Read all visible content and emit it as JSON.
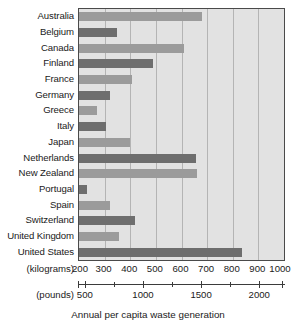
{
  "chart_data": {
    "type": "bar",
    "orientation": "horizontal",
    "title": "",
    "xlabel": "Annual per capita waste generation",
    "ylabel": "",
    "categories": [
      "Australia",
      "Belgium",
      "Canada",
      "Finland",
      "France",
      "Germany",
      "Greece",
      "Italy",
      "Japan",
      "Netherlands",
      "New Zealand",
      "Portugal",
      "Spain",
      "Switzerland",
      "United Kingdom",
      "United States"
    ],
    "values": [
      680,
      350,
      610,
      490,
      405,
      320,
      270,
      305,
      400,
      655,
      660,
      230,
      320,
      420,
      355,
      835
    ],
    "value_unit": "kilograms",
    "xlim": [
      200,
      1000
    ],
    "xticks": [
      200,
      300,
      400,
      500,
      600,
      700,
      800,
      900,
      1000
    ],
    "xtick_labels": [
      "200",
      "300",
      "400",
      "500",
      "600",
      "700",
      "800",
      "900",
      "1000"
    ],
    "secondary_axis": {
      "unit": "pounds",
      "lim": [
        441,
        2205
      ],
      "ticks": [
        500,
        1000,
        1500,
        2000
      ],
      "tick_labels": [
        "500",
        "1000",
        "1500",
        "2000"
      ],
      "minor_ticks": [
        750,
        1250,
        1750
      ]
    },
    "axis_unit_labels": {
      "primary": "(kilograms)",
      "secondary": "(pounds)"
    },
    "grid": true,
    "legend": "none",
    "colors": {
      "bar_light": "#9b9b9b",
      "bar_dark": "#6e6e6e",
      "plot_background": "#e2e2e2",
      "gridline": "#b4b4b4",
      "axis": "#3b3b3b",
      "text": "#1a1a1a"
    }
  }
}
